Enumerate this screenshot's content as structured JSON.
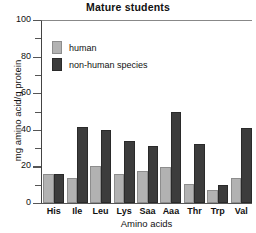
{
  "chart_data": {
    "type": "bar",
    "title": "Mature students",
    "xlabel": "Amino acids",
    "ylabel": "mg amino acid/g protein",
    "categories": [
      "His",
      "Ile",
      "Leu",
      "Lys",
      "Saa",
      "Aaa",
      "Thr",
      "Trp",
      "Val"
    ],
    "series": [
      {
        "name": "human",
        "color": "#b2b2b2",
        "values": [
          16,
          13.5,
          20,
          16,
          17.5,
          19.5,
          10.5,
          7,
          13.5
        ]
      },
      {
        "name": "non-human species",
        "color": "#3c3c3c",
        "values": [
          16,
          41.5,
          40,
          34,
          31,
          50,
          32,
          10,
          41
        ]
      }
    ],
    "ylim": [
      0,
      100
    ],
    "yticks": [
      0,
      20,
      40,
      60,
      80,
      100
    ],
    "ytick_labels": [
      "0",
      "20",
      "40",
      "60",
      "80",
      "100"
    ],
    "yminor_ticks": [
      10,
      30,
      50,
      70,
      90
    ],
    "grid": false,
    "legend_position": "upper-left"
  }
}
